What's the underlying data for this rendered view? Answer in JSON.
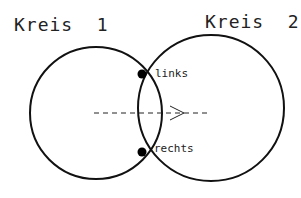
{
  "diagram": {
    "circle1": {
      "label": "Kreis  1",
      "cx": 96,
      "cy": 113,
      "r": 66
    },
    "circle2": {
      "label": "Kreis  2",
      "cx": 211,
      "cy": 108,
      "r": 73
    },
    "intersections": [
      {
        "label": "links",
        "x": 142,
        "y": 74
      },
      {
        "label": "rechts",
        "x": 142,
        "y": 152
      }
    ],
    "dashed_line": {
      "x1": 94,
      "x2": 208,
      "y": 113,
      "arrow_x": 184
    },
    "colors": {
      "stroke": "#111111",
      "text": "#222222",
      "background": "#ffffff"
    }
  }
}
